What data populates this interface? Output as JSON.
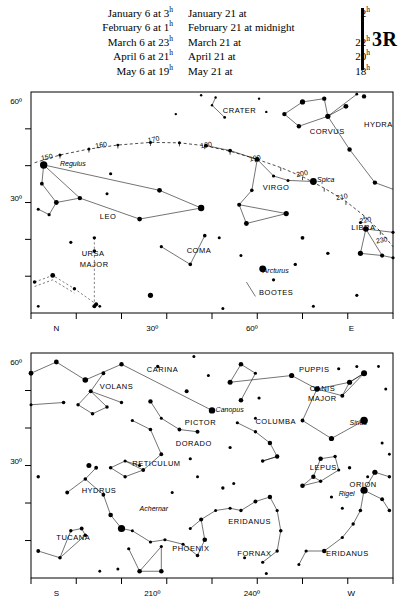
{
  "header": {
    "column1": [
      {
        "label": "January 6 at",
        "value": "3",
        "sup": "h"
      },
      {
        "label": "February 6 at",
        "value": "1",
        "sup": "h"
      },
      {
        "label": "March 6 at",
        "value": "23",
        "sup": "h"
      },
      {
        "label": "April 6 at",
        "value": "21",
        "sup": "h"
      },
      {
        "label": "May 6 at",
        "value": "19",
        "sup": "h"
      }
    ],
    "column2": [
      {
        "label": "January 21 at",
        "value": "2",
        "sup": "h"
      },
      {
        "label": "February 21 at midnight",
        "value": "",
        "sup": ""
      },
      {
        "label": "March 21 at",
        "value": "22",
        "sup": "h"
      },
      {
        "label": "April 21 at",
        "value": "20",
        "sup": "h"
      },
      {
        "label": "May 21 at",
        "value": "18",
        "sup": "h"
      }
    ],
    "plate_id": "3R"
  },
  "chart_data": [
    {
      "id": "northern-panel",
      "type": "scatter",
      "title": "",
      "xlabel": "",
      "ylabel": "",
      "xlim": [
        0,
        100
      ],
      "ylim": [
        0,
        100
      ],
      "grid": false,
      "x_tick_labels": [
        "N",
        "30º",
        "60º",
        "E"
      ],
      "y_tick_labels": [
        "60º",
        "30º"
      ],
      "ecliptic_labels": [
        "150",
        "160",
        "170",
        "180",
        "190",
        "200",
        "210",
        "220",
        "230"
      ],
      "constellations": [
        "CRATER",
        "CORVUS",
        "HYDRA",
        "VIRGO",
        "LEO",
        "URSA MAJOR",
        "COMA",
        "BOOTES",
        "LIBRA"
      ],
      "named_stars": [
        "Regulus",
        "Spica",
        "Arcturus"
      ]
    },
    {
      "id": "southern-panel",
      "type": "scatter",
      "title": "",
      "xlabel": "",
      "ylabel": "",
      "xlim": [
        0,
        100
      ],
      "ylim": [
        0,
        100
      ],
      "grid": false,
      "x_tick_labels": [
        "S",
        "210º",
        "240º",
        "W"
      ],
      "y_tick_labels": [
        "60º",
        "30º"
      ],
      "constellations": [
        "CARINA",
        "VOLANS",
        "PUPPIS",
        "CANIS MAJOR",
        "PICTOR",
        "COLUMBA",
        "DORADO",
        "RETICULUM",
        "LEPUS",
        "ORION",
        "HYDRUS",
        "TUCANA",
        "PHOENIX",
        "ERIDANUS",
        "FORNAX",
        "ERIDANUS"
      ],
      "named_stars": [
        "Canopus",
        "Sirius",
        "Achernar",
        "Rigel"
      ]
    }
  ],
  "top_chart": {
    "axis": {
      "x_labels": [
        {
          "text": "N",
          "x": 7
        },
        {
          "text": "30º",
          "x": 33.5
        },
        {
          "text": "60º",
          "x": 61
        },
        {
          "text": "E",
          "x": 88.5
        }
      ],
      "y_labels": [
        {
          "text": "60º",
          "y": 4
        },
        {
          "text": "30º",
          "y": 48
        }
      ]
    },
    "ecliptic_labels": [
      {
        "text": "150",
        "x": 4.5,
        "y": 30.5
      },
      {
        "text": "160",
        "x": 19.5,
        "y": 25
      },
      {
        "text": "170",
        "x": 34,
        "y": 22.5
      },
      {
        "text": "180",
        "x": 48.5,
        "y": 25
      },
      {
        "text": "190",
        "x": 62,
        "y": 31
      },
      {
        "text": "200",
        "x": 75,
        "y": 38
      },
      {
        "text": "210",
        "x": 86,
        "y": 48.5
      },
      {
        "text": "220",
        "x": 92.5,
        "y": 59
      },
      {
        "text": "230",
        "x": 97,
        "y": 68
      }
    ],
    "constellation_labels": [
      {
        "text": "CRATER",
        "x": 53,
        "y": 9.5,
        "size": 7.5
      },
      {
        "text": "CORVUS",
        "x": 77,
        "y": 19,
        "size": 7.5
      },
      {
        "text": "HYDRA",
        "x": 92,
        "y": 16,
        "size": 7.5
      },
      {
        "text": "VIRGO",
        "x": 64,
        "y": 44.5,
        "size": 7.5
      },
      {
        "text": "LEO",
        "x": 19,
        "y": 57.5,
        "size": 7.5
      },
      {
        "text": "URSA",
        "x": 14,
        "y": 74,
        "size": 7.5
      },
      {
        "text": "MAJOR",
        "x": 13.5,
        "y": 79,
        "size": 7.5
      },
      {
        "text": "COMA",
        "x": 43,
        "y": 73,
        "size": 7.5
      },
      {
        "text": "BOOTES",
        "x": 63,
        "y": 92,
        "size": 7.5
      },
      {
        "text": "LIBRA",
        "x": 88.5,
        "y": 62.5,
        "size": 7.5
      }
    ],
    "star_labels": [
      {
        "text": "Regulus",
        "x": 8,
        "y": 33.5
      },
      {
        "text": "Spica",
        "x": 79,
        "y": 40.5
      },
      {
        "text": "Arcturus",
        "x": 64,
        "y": 82
      }
    ]
  },
  "bottom_chart": {
    "axis": {
      "x_labels": [
        {
          "text": "S",
          "x": 7
        },
        {
          "text": "210º",
          "x": 33.5
        },
        {
          "text": "240º",
          "x": 61
        },
        {
          "text": "W",
          "x": 88.5
        }
      ],
      "y_labels": [
        {
          "text": "60º",
          "y": 4
        },
        {
          "text": "30º",
          "y": 48
        }
      ]
    },
    "constellation_labels": [
      {
        "text": "CARINA",
        "x": 32,
        "y": 8.5
      },
      {
        "text": "VOLANS",
        "x": 19,
        "y": 16
      },
      {
        "text": "PUPPIS",
        "x": 74,
        "y": 8.5
      },
      {
        "text": "CANIS",
        "x": 77,
        "y": 17
      },
      {
        "text": "MAJOR",
        "x": 76.5,
        "y": 21.5
      },
      {
        "text": "PICTOR",
        "x": 42.5,
        "y": 32
      },
      {
        "text": "COLUMBA",
        "x": 62,
        "y": 31.5
      },
      {
        "text": "DORADO",
        "x": 40,
        "y": 41.5
      },
      {
        "text": "RETICULUM",
        "x": 28,
        "y": 50
      },
      {
        "text": "LEPUS",
        "x": 77,
        "y": 52
      },
      {
        "text": "ORION",
        "x": 88,
        "y": 59.5
      },
      {
        "text": "HYDRUS",
        "x": 14,
        "y": 62
      },
      {
        "text": "TUCANA",
        "x": 7,
        "y": 83
      },
      {
        "text": "PHOENIX",
        "x": 39,
        "y": 88
      },
      {
        "text": "ERIDANUS",
        "x": 54.5,
        "y": 76
      },
      {
        "text": "FORNAX",
        "x": 57,
        "y": 90
      },
      {
        "text": "ERIDANUS",
        "x": 81.5,
        "y": 90
      }
    ],
    "star_labels": [
      {
        "text": "Canopus",
        "x": 51,
        "y": 26
      },
      {
        "text": "Sirius",
        "x": 88,
        "y": 32
      },
      {
        "text": "Achernar",
        "x": 30,
        "y": 70
      },
      {
        "text": "Rigel",
        "x": 85,
        "y": 63.5
      }
    ]
  }
}
